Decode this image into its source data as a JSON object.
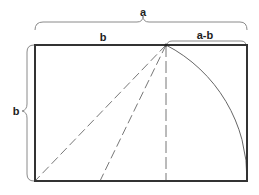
{
  "diagram": {
    "title": "",
    "type": "golden-rectangle-construction",
    "labels": {
      "top_total": "a",
      "square_side_top": "b",
      "remainder_top": "a-b",
      "left_side": "b"
    },
    "colors": {
      "stroke": "#333333",
      "dashed": "#777777",
      "arc": "#666666",
      "brace": "#888888",
      "text": "#222222",
      "background": "#ffffff"
    },
    "geometry": {
      "rectangle": {
        "x1": 35,
        "y1": 45,
        "x2": 247,
        "y2": 181
      },
      "apex": {
        "x": 166,
        "y": 45
      },
      "dashed_lines": [
        {
          "from": [
            166,
            45
          ],
          "to": [
            35,
            181
          ]
        },
        {
          "from": [
            166,
            45
          ],
          "to": [
            100,
            181
          ]
        },
        {
          "from": [
            166,
            45
          ],
          "to": [
            166,
            181
          ]
        }
      ],
      "arc": {
        "center": [
          100,
          181
        ],
        "from": [
          166,
          45
        ],
        "to": [
          247,
          181
        ]
      }
    }
  }
}
